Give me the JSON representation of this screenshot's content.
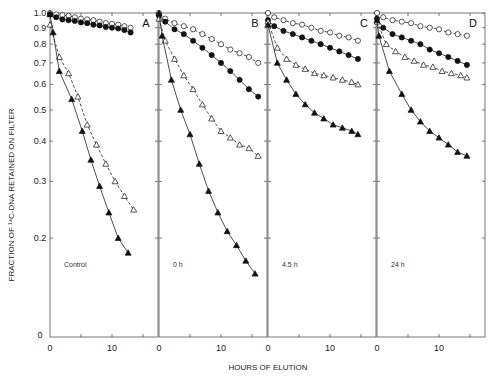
{
  "chart_data": {
    "type": "line",
    "ylabel": "FRACTION OF 14C-DNA RETAINED ON FILTER",
    "xlabel": "HOURS OF ELUTION",
    "yscale": "log",
    "yticks": [
      1.0,
      0.9,
      0.8,
      0.7,
      0.6,
      0.5,
      0.4,
      0.3,
      0.2
    ],
    "ytick_labels": [
      "1.0",
      "0.9",
      "0.8",
      "0.7",
      "0.6",
      "0.5",
      "0.4",
      "0.3",
      "0.2",
      "0"
    ],
    "xticks": [
      0,
      10
    ],
    "xlim": [
      0,
      17.5
    ],
    "legend_markers": {
      "open_circle": "open circles, dashed line",
      "filled_circle": "filled circles, solid line",
      "open_triangle": "open triangles, dashed line",
      "filled_triangle": "filled triangles, solid line"
    },
    "panels": [
      {
        "letter": "A",
        "condition": "Control",
        "series": [
          {
            "name": "open_circle",
            "x": [
              0,
              1,
              2,
              3,
              4,
              5,
              6,
              7,
              8,
              9,
              10,
              11,
              12,
              13
            ],
            "y": [
              1.0,
              0.99,
              0.985,
              0.98,
              0.97,
              0.96,
              0.955,
              0.95,
              0.94,
              0.93,
              0.925,
              0.92,
              0.91,
              0.9
            ]
          },
          {
            "name": "filled_circle",
            "x": [
              0,
              1,
              2,
              3,
              4,
              5,
              6,
              7,
              8,
              9,
              10,
              11,
              12,
              13
            ],
            "y": [
              0.99,
              0.97,
              0.955,
              0.95,
              0.945,
              0.935,
              0.93,
              0.92,
              0.915,
              0.905,
              0.9,
              0.895,
              0.885,
              0.87
            ]
          },
          {
            "name": "open_triangle",
            "x": [
              0,
              1.5,
              3,
              4.5,
              6,
              7.5,
              9,
              10.5,
              12,
              13.5
            ],
            "y": [
              0.92,
              0.73,
              0.65,
              0.55,
              0.45,
              0.39,
              0.34,
              0.3,
              0.27,
              0.245
            ]
          },
          {
            "name": "filled_triangle",
            "x": [
              0,
              0.5,
              1.5,
              3.5,
              5.2,
              6.6,
              8.0,
              9.5,
              11,
              12.6
            ],
            "y": [
              0.99,
              0.87,
              0.66,
              0.54,
              0.43,
              0.35,
              0.29,
              0.24,
              0.2,
              0.18
            ]
          }
        ]
      },
      {
        "letter": "B",
        "condition": "0 h",
        "series": [
          {
            "name": "open_circle",
            "x": [
              0,
              1,
              2.5,
              4,
              5.5,
              7,
              8.5,
              10,
              11.5,
              13,
              14.5,
              16
            ],
            "y": [
              1.0,
              0.96,
              0.93,
              0.91,
              0.89,
              0.86,
              0.83,
              0.8,
              0.77,
              0.75,
              0.73,
              0.7
            ]
          },
          {
            "name": "filled_circle",
            "x": [
              0,
              1,
              2.5,
              4,
              5.5,
              7,
              8.5,
              10,
              11.5,
              13,
              14.5,
              16
            ],
            "y": [
              0.98,
              0.94,
              0.89,
              0.86,
              0.82,
              0.78,
              0.74,
              0.7,
              0.66,
              0.62,
              0.58,
              0.55
            ]
          },
          {
            "name": "open_triangle",
            "x": [
              0,
              1,
              2.5,
              4,
              5.5,
              7,
              8.5,
              10,
              11.5,
              13,
              14.5,
              16
            ],
            "y": [
              0.96,
              0.82,
              0.72,
              0.64,
              0.58,
              0.52,
              0.47,
              0.43,
              0.41,
              0.39,
              0.38,
              0.36
            ]
          },
          {
            "name": "filled_triangle",
            "x": [
              0,
              0.5,
              2,
              3.5,
              5,
              6.5,
              8,
              9.5,
              11,
              12.5,
              14,
              15.5
            ],
            "y": [
              1.0,
              0.85,
              0.62,
              0.5,
              0.42,
              0.34,
              0.28,
              0.24,
              0.21,
              0.19,
              0.17,
              0.155
            ]
          }
        ]
      },
      {
        "letter": "C",
        "condition": "4.5 h",
        "series": [
          {
            "name": "open_circle",
            "x": [
              0,
              1,
              2.5,
              4,
              5.5,
              7,
              8.5,
              10,
              11.5,
              13,
              14.5
            ],
            "y": [
              1.0,
              0.97,
              0.95,
              0.93,
              0.92,
              0.9,
              0.88,
              0.87,
              0.85,
              0.84,
              0.82
            ]
          },
          {
            "name": "filled_circle",
            "x": [
              0,
              1,
              2.5,
              4,
              5.5,
              7,
              8.5,
              10,
              11.5,
              13,
              14.5
            ],
            "y": [
              0.95,
              0.91,
              0.88,
              0.86,
              0.84,
              0.82,
              0.8,
              0.78,
              0.76,
              0.74,
              0.72
            ]
          },
          {
            "name": "open_triangle",
            "x": [
              0,
              1.5,
              3,
              4.5,
              6,
              7.5,
              9,
              10.5,
              12,
              13.5,
              14.5
            ],
            "y": [
              0.94,
              0.78,
              0.72,
              0.69,
              0.67,
              0.65,
              0.64,
              0.63,
              0.62,
              0.61,
              0.6
            ]
          },
          {
            "name": "filled_triangle",
            "x": [
              0,
              1.5,
              3,
              4.5,
              6,
              7.5,
              9,
              10.5,
              12,
              13.5,
              14.5
            ],
            "y": [
              0.92,
              0.7,
              0.62,
              0.56,
              0.52,
              0.49,
              0.47,
              0.45,
              0.44,
              0.43,
              0.42
            ]
          }
        ]
      },
      {
        "letter": "D",
        "condition": "24 h",
        "series": [
          {
            "name": "open_circle",
            "x": [
              0,
              1,
              2.5,
              4,
              5.5,
              7,
              8.5,
              10,
              11.5,
              13,
              14.5
            ],
            "y": [
              1.0,
              0.97,
              0.95,
              0.94,
              0.93,
              0.91,
              0.9,
              0.89,
              0.87,
              0.86,
              0.85
            ]
          },
          {
            "name": "filled_circle",
            "x": [
              0,
              1,
              2.5,
              4,
              5.5,
              7,
              8.5,
              10,
              11.5,
              13,
              14.5
            ],
            "y": [
              0.96,
              0.9,
              0.86,
              0.84,
              0.82,
              0.8,
              0.77,
              0.75,
              0.73,
              0.71,
              0.69
            ]
          },
          {
            "name": "open_triangle",
            "x": [
              0,
              1.5,
              3,
              4.5,
              6,
              7.5,
              9,
              10.5,
              12,
              13.5,
              14.5
            ],
            "y": [
              0.94,
              0.8,
              0.76,
              0.73,
              0.71,
              0.69,
              0.68,
              0.66,
              0.65,
              0.64,
              0.63
            ]
          },
          {
            "name": "filled_triangle",
            "x": [
              0,
              0.3,
              2,
              4,
              5.5,
              7,
              8.5,
              10,
              11.5,
              13,
              14.5
            ],
            "y": [
              0.95,
              0.85,
              0.66,
              0.56,
              0.5,
              0.46,
              0.43,
              0.41,
              0.39,
              0.37,
              0.36
            ]
          }
        ]
      }
    ]
  },
  "labels": {
    "ylabel": "FRACTION OF ¹⁴C-DNA RETAINED ON FILTER",
    "xlabel": "HOURS OF ELUTION",
    "x_zero": "0",
    "x_ten": "10",
    "y_zero": "0"
  }
}
